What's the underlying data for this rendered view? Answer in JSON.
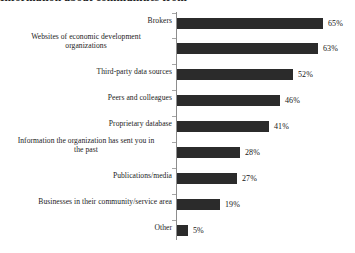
{
  "chart_title": "Information about communities from",
  "chart_data": {
    "type": "bar",
    "orientation": "horizontal",
    "title": "Information about communities from",
    "xlabel": "",
    "ylabel": "",
    "xlim": [
      0,
      70
    ],
    "grid": false,
    "legend": false,
    "value_suffix": "%",
    "bar_color": "#2b2b2b",
    "axis_color": "#8d8d8d",
    "categories": [
      "Brokers",
      "Websites of economic development organizations",
      "Third-party data sources",
      "Peers and colleagues",
      "Proprietary database",
      "Information the organization has sent you in the past",
      "Publications/media",
      "Businesses in their community/service area",
      "Other"
    ],
    "values": [
      65,
      63,
      52,
      46,
      41,
      28,
      27,
      19,
      5
    ],
    "value_labels": [
      "65%",
      "63%",
      "52%",
      "46%",
      "41%",
      "28%",
      "27%",
      "19%",
      "5%"
    ]
  },
  "rows": [
    {
      "label": "Brokers",
      "label_line1": "Brokers",
      "label_line2": "",
      "value": 65,
      "value_label": "65%",
      "two_line": false,
      "bar_top": 6,
      "label_top": 4,
      "tick_top": 1
    },
    {
      "label": "Websites of economic development organizations",
      "label_line1": "Websites of economic development",
      "label_line2": "organizations",
      "value": 63,
      "value_label": "63%",
      "two_line": true,
      "bar_top": 31,
      "label_top": 20,
      "tick_top": 26
    },
    {
      "label": "Third-party data sources",
      "label_line1": "Third-party data sources",
      "label_line2": "",
      "value": 52,
      "value_label": "52%",
      "two_line": false,
      "bar_top": 57,
      "label_top": 55,
      "tick_top": 52
    },
    {
      "label": "Peers and colleagues",
      "label_line1": "Peers and colleagues",
      "label_line2": "",
      "value": 46,
      "value_label": "46%",
      "two_line": false,
      "bar_top": 83,
      "label_top": 81,
      "tick_top": 78
    },
    {
      "label": "Proprietary database",
      "label_line1": "Proprietary database",
      "label_line2": "",
      "value": 41,
      "value_label": "41%",
      "two_line": false,
      "bar_top": 109,
      "label_top": 107,
      "tick_top": 104
    },
    {
      "label": "Information the organization has sent you in the past",
      "label_line1": "Information the organization has sent you in",
      "label_line2": "the past",
      "value": 28,
      "value_label": "28%",
      "two_line": true,
      "bar_top": 135,
      "label_top": 124,
      "tick_top": 130
    },
    {
      "label": "Publications/media",
      "label_line1": "Publications/media",
      "label_line2": "",
      "value": 27,
      "value_label": "27%",
      "two_line": false,
      "bar_top": 161,
      "label_top": 159,
      "tick_top": 156
    },
    {
      "label": "Businesses in their community/service area",
      "label_line1": "Businesses in their community/service area",
      "label_line2": "",
      "value": 19,
      "value_label": "19%",
      "two_line": false,
      "bar_top": 187,
      "label_top": 185,
      "tick_top": 182
    },
    {
      "label": "Other",
      "label_line1": "Other",
      "label_line2": "",
      "value": 5,
      "value_label": "5%",
      "two_line": false,
      "bar_top": 213,
      "label_top": 211,
      "tick_top": 208
    }
  ]
}
